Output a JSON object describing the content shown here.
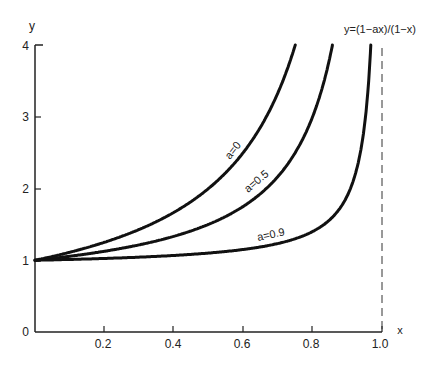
{
  "chart_data": {
    "type": "line",
    "title": "y=(1−ax)/(1−x)",
    "xlabel": "x",
    "ylabel": "y",
    "xlim": [
      0,
      1.0
    ],
    "ylim": [
      0,
      4
    ],
    "grid": false,
    "legend": "inline curve labels",
    "x_ticks": [
      "0.2",
      "0.4",
      "0.6",
      "0.8",
      "1.0"
    ],
    "y_ticks": [
      "0",
      "1",
      "2",
      "3",
      "4"
    ],
    "asymptote": {
      "x": 1.0,
      "style": "dashed"
    },
    "series": [
      {
        "name": "a=0",
        "a": 0,
        "x": [
          0,
          0.1,
          0.2,
          0.3,
          0.4,
          0.5,
          0.6,
          0.7,
          0.75
        ],
        "y": [
          1,
          1.11,
          1.25,
          1.43,
          1.67,
          2.0,
          2.5,
          3.33,
          4.0
        ]
      },
      {
        "name": "a=0.5",
        "a": 0.5,
        "x": [
          0,
          0.1,
          0.2,
          0.3,
          0.4,
          0.5,
          0.6,
          0.7,
          0.8,
          0.857
        ],
        "y": [
          1,
          1.06,
          1.13,
          1.21,
          1.33,
          1.5,
          1.75,
          2.17,
          3.0,
          4.0
        ]
      },
      {
        "name": "a=0.9",
        "a": 0.9,
        "x": [
          0,
          0.2,
          0.4,
          0.6,
          0.7,
          0.8,
          0.85,
          0.9,
          0.95,
          0.967
        ],
        "y": [
          1,
          1.03,
          1.07,
          1.15,
          1.23,
          1.4,
          1.6,
          2.0,
          2.9,
          4.0
        ]
      }
    ]
  },
  "labels": {
    "formula": "y=(1−ax)/(1−x)",
    "x_axis": "x",
    "y_axis": "y",
    "curve_a0": "a=0",
    "curve_a05": "a=0.5",
    "curve_a09": "a=0.9",
    "xt": [
      "0.2",
      "0.4",
      "0.6",
      "0.8",
      "1.0"
    ],
    "yt": [
      "0",
      "1",
      "2",
      "3",
      "4"
    ]
  }
}
